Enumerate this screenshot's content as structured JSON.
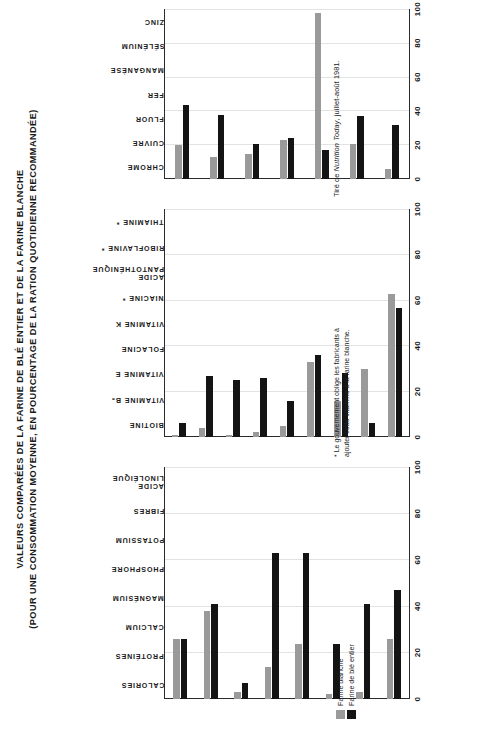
{
  "title": {
    "line1": "VALEURS COMPARÉES DE LA FARINE DE BLÉ ENTIER ET DE LA FARINE BLANCHE",
    "line2": "(POUR UNE CONSOMMATION MOYENNE, EN POURCENTAGE DE LA RATION QUOTIDIENNE RECOMMANDÉE)"
  },
  "legend": {
    "items": [
      {
        "label": "Farine blanche",
        "color": "#9a9a9a",
        "key": "white"
      },
      {
        "label": "Farine de blé entier",
        "color": "#141414",
        "key": "whole"
      }
    ]
  },
  "notes": {
    "footnote_star": "* Le gouvernement oblige les fabricants à ajouter cette vitamine à la farine blanche.",
    "source_prefix": "Tiré de ",
    "source_italic": "Nutrition Today",
    "source_suffix": ", juillet-août 1981."
  },
  "axis": {
    "ticks": [
      "0",
      "20",
      "40",
      "60",
      "80",
      "100"
    ],
    "min": 0,
    "max": 100
  },
  "chart_data": [
    {
      "type": "bar",
      "panel": "macronutriments",
      "title": "",
      "xlabel": "Pourcentage de la ration quotidienne recommandée",
      "ylabel": "",
      "xlim": [
        0,
        100
      ],
      "grid": true,
      "orientation": "horizontal",
      "categories": [
        "CALORIES",
        "PROTÉINES",
        "CALCIUM",
        "MAGNÉSIUM",
        "PHOSPHORE",
        "POTASSIUM",
        "FIBRES",
        "ACIDE LINOLÉIQUE"
      ],
      "series": [
        {
          "name": "Farine blanche",
          "values": [
            26,
            38,
            3,
            14,
            24,
            2,
            3,
            26
          ]
        },
        {
          "name": "Farine de blé entier",
          "values": [
            26,
            41,
            7,
            63,
            63,
            24,
            41,
            47
          ]
        }
      ]
    },
    {
      "type": "bar",
      "panel": "vitamines",
      "title": "",
      "xlabel": "Pourcentage de la ration quotidienne recommandée",
      "ylabel": "",
      "xlim": [
        0,
        100
      ],
      "grid": true,
      "orientation": "horizontal",
      "categories": [
        "BIOTINE",
        "VITAMINE B₆",
        "VITAMINE E",
        "FOLACINE",
        "VITAMINE K",
        "NIACINE *",
        "ACIDE PANTOTHÉNIQUE",
        "RIBOFLAVINE *",
        "THIAMINE *"
      ],
      "series": [
        {
          "name": "Farine blanche",
          "values": [
            1,
            4,
            1,
            2,
            5,
            33,
            16,
            30,
            63
          ]
        },
        {
          "name": "Farine de blé entier",
          "values": [
            6,
            27,
            25,
            26,
            16,
            36,
            28,
            6,
            57
          ]
        }
      ]
    },
    {
      "type": "bar",
      "panel": "mineraux",
      "title": "",
      "xlabel": "Pourcentage de la ration quotidienne recommandée",
      "ylabel": "",
      "xlim": [
        0,
        100
      ],
      "grid": true,
      "orientation": "horizontal",
      "categories": [
        "CHROME",
        "CUIVRE",
        "FLUOR",
        "FER",
        "MANGANÈSE",
        "SÉLÉNIUM",
        "ZINC"
      ],
      "series": [
        {
          "name": "Farine blanche",
          "values": [
            20,
            13,
            15,
            23,
            98,
            21,
            6
          ]
        },
        {
          "name": "Farine de blé entier",
          "values": [
            44,
            38,
            21,
            24,
            17,
            37,
            32
          ]
        }
      ]
    }
  ]
}
